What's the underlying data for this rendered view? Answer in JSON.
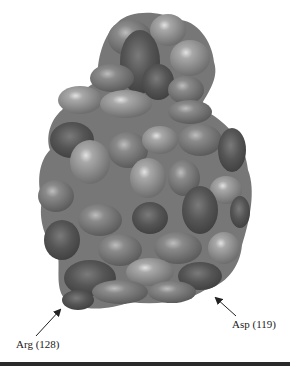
{
  "figure": {
    "colors": {
      "background": "#ffffff",
      "surface_light": "#9a9a9a",
      "surface_mid": "#7e7e7e",
      "surface_dark": "#555555",
      "highlight": "#d8d8d8",
      "rule": "#2a2a2a",
      "text": "#222222"
    },
    "annotations": [
      {
        "label": "Arg (128)",
        "residue": "Arg",
        "number": "128",
        "arrow_from": [
          36,
          336
        ],
        "arrow_to": [
          62,
          308
        ]
      },
      {
        "label": "Asp (119)",
        "residue": "Asp",
        "number": "119",
        "arrow_from": [
          236,
          316
        ],
        "arrow_to": [
          214,
          296
        ]
      }
    ]
  }
}
